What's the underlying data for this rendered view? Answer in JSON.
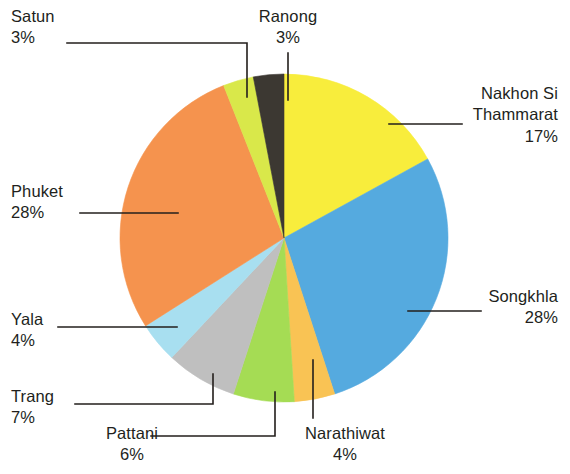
{
  "chart_data": {
    "type": "pie",
    "title": "",
    "subtitle": "",
    "xlabel": "",
    "ylabel": "",
    "legend_position": "callout-labels",
    "grid": false,
    "units": "percent",
    "total": 100,
    "start_angle_deg": 0,
    "direction": "clockwise",
    "categories": [
      "Nakhon Si Thammarat",
      "Songkhla",
      "Narathiwat",
      "Pattani",
      "Trang",
      "Yala",
      "Phuket",
      "Satun",
      "Ranong"
    ],
    "values": [
      17,
      28,
      4,
      6,
      7,
      4,
      28,
      3,
      3
    ],
    "colors": [
      "#f8ed3c",
      "#55aadf",
      "#f9c354",
      "#a5dc54",
      "#bfbfbf",
      "#a8dff0",
      "#f5934e",
      "#d9e84a",
      "#3c3832"
    ],
    "slices": [
      {
        "label": "Nakhon Si Thammarat",
        "value": 17,
        "value_text": "17%",
        "color": "#f8ed3c"
      },
      {
        "label": "Songkhla",
        "value": 28,
        "value_text": "28%",
        "color": "#55aadf"
      },
      {
        "label": "Narathiwat",
        "value": 4,
        "value_text": "4%",
        "color": "#f9c354"
      },
      {
        "label": "Pattani",
        "value": 6,
        "value_text": "6%",
        "color": "#a5dc54"
      },
      {
        "label": "Trang",
        "value": 7,
        "value_text": "7%",
        "color": "#bfbfbf"
      },
      {
        "label": "Yala",
        "value": 4,
        "value_text": "4%",
        "color": "#a8dff0"
      },
      {
        "label": "Phuket",
        "value": 28,
        "value_text": "28%",
        "color": "#f5934e"
      },
      {
        "label": "Satun",
        "value": 3,
        "value_text": "3%",
        "color": "#d9e84a"
      },
      {
        "label": "Ranong",
        "value": 3,
        "value_text": "3%",
        "color": "#3c3832"
      }
    ]
  },
  "labels": {
    "satun": {
      "name": "Satun",
      "pct": "3%"
    },
    "ranong": {
      "name": "Ranong",
      "pct": "3%"
    },
    "nakhon": {
      "name_line1": "Nakhon Si",
      "name_line2": "Thammarat",
      "pct": "17%"
    },
    "songkhla": {
      "name": "Songkhla",
      "pct": "28%"
    },
    "narathiwat": {
      "name": "Narathiwat",
      "pct": "4%"
    },
    "pattani": {
      "name": "Pattani",
      "pct": "6%"
    },
    "trang": {
      "name": "Trang",
      "pct": "7%"
    },
    "yala": {
      "name": "Yala",
      "pct": "4%"
    },
    "phuket": {
      "name": "Phuket",
      "pct": "28%"
    }
  }
}
